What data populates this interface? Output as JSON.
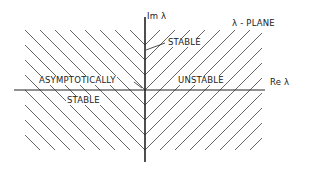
{
  "diagram": {
    "title": "λ - PLANE",
    "axes": {
      "imaginary_label": "Im λ",
      "real_label": "Re λ"
    },
    "regions": {
      "left": {
        "label_line1": "ASYMPTOTICALLY",
        "label_line2": "STABLE",
        "hatch": "backslash"
      },
      "right": {
        "label": "UNSTABLE",
        "hatch": "slash"
      },
      "imaginary_axis": {
        "label": "STABLE"
      }
    },
    "colors": {
      "line": "#222222",
      "hatch": "#555555",
      "background": "#ffffff"
    }
  }
}
